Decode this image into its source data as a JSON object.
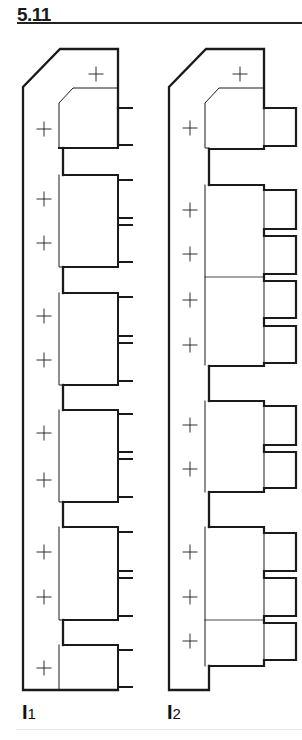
{
  "figure": {
    "number": "5.11",
    "panels": [
      {
        "label_main": "I",
        "label_sub": "1",
        "description": "outline with six stacked blocks, single pin terminals on right"
      },
      {
        "label_main": "I",
        "label_sub": "2",
        "description": "outline with stacked blocks and box-shaped terminals on right"
      }
    ],
    "colors": {
      "line": "#1a1a1a",
      "background": "#ffffff"
    }
  }
}
